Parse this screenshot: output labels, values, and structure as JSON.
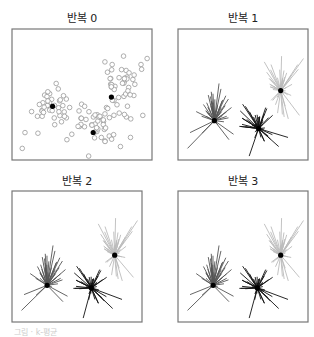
{
  "chart_data": {
    "type": "scatter",
    "panels": [
      {
        "title": "반복 0",
        "mode": "points",
        "frame": [
          12,
          29,
          152,
          160
        ]
      },
      {
        "title": "반복 1",
        "mode": "star",
        "frame": [
          178,
          29,
          308,
          160
        ]
      },
      {
        "title": "반복 2",
        "mode": "star",
        "frame": [
          12,
          191,
          142,
          322
        ]
      },
      {
        "title": "반복 3",
        "mode": "star",
        "frame": [
          178,
          191,
          308,
          322
        ]
      }
    ],
    "clusters": [
      {
        "name": "cluster-left",
        "color": "#555555",
        "cx": 0.3,
        "cy": 0.62,
        "sx": 0.11,
        "sy": 0.1,
        "n": 45
      },
      {
        "name": "cluster-middle",
        "color": "#111111",
        "cx": 0.6,
        "cy": 0.72,
        "sx": 0.1,
        "sy": 0.08,
        "n": 45
      },
      {
        "name": "cluster-right",
        "color": "#bbbbbb",
        "cx": 0.78,
        "cy": 0.42,
        "sx": 0.08,
        "sy": 0.13,
        "n": 45
      }
    ],
    "centers": [
      [
        [
          0.29,
          0.59
        ],
        [
          0.58,
          0.79
        ],
        [
          0.71,
          0.52
        ]
      ],
      [
        [
          0.28,
          0.7
        ],
        [
          0.62,
          0.76
        ],
        [
          0.79,
          0.47
        ]
      ],
      [
        [
          0.27,
          0.72
        ],
        [
          0.61,
          0.74
        ],
        [
          0.79,
          0.49
        ]
      ],
      [
        [
          0.27,
          0.72
        ],
        [
          0.61,
          0.74
        ],
        [
          0.79,
          0.49
        ]
      ]
    ],
    "xlabel": "",
    "ylabel": "",
    "grid": false,
    "legend": false
  },
  "footer": {
    "text": "그림 · k-평균"
  }
}
